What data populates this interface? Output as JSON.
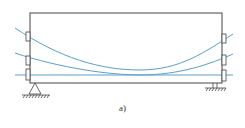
{
  "figure": {
    "caption": "a)",
    "beam": {
      "x": 30,
      "y": 13,
      "width": 192,
      "height": 70,
      "stroke": "#444444"
    },
    "cable_color": "#5aa0c8",
    "cables": [
      {
        "name": "top-cable",
        "path": "M15,28 C60,58 100,70 140,70 C180,70 205,52 233,34"
      },
      {
        "name": "middle-cable",
        "path": "M15,53 C60,68 110,75 140,75 C180,75 210,64 233,54"
      },
      {
        "name": "bottom-cable",
        "path": "M15,75 L233,75"
      }
    ],
    "anchors_left": [
      {
        "y": 32
      },
      {
        "y": 56
      },
      {
        "y": 71
      }
    ],
    "anchors_right": [
      {
        "y": 34
      },
      {
        "y": 56
      },
      {
        "y": 71
      }
    ],
    "supports": {
      "left": {
        "type": "pin",
        "x": 35
      },
      "right": {
        "type": "roller",
        "x": 215
      }
    }
  }
}
